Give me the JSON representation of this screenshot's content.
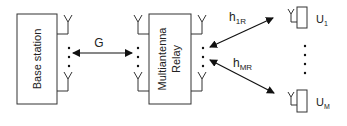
{
  "diagram": {
    "nodes": {
      "base_station": {
        "label": "Base station"
      },
      "relay": {
        "label_line1": "Multiantenna",
        "label_line2": "Relay"
      },
      "user_first": {
        "label": "U",
        "subscript": "1"
      },
      "user_last": {
        "label": "U",
        "subscript": "M"
      }
    },
    "links": {
      "bs_relay": {
        "label": "G",
        "direction": "bidirectional"
      },
      "relay_user1": {
        "label": "h",
        "subscript": "1R",
        "direction": "bidirectional"
      },
      "relay_userM": {
        "label": "h",
        "subscript": "MR",
        "direction": "bidirectional"
      }
    },
    "colors": {
      "stroke": "#222222",
      "background": "#ffffff"
    }
  }
}
